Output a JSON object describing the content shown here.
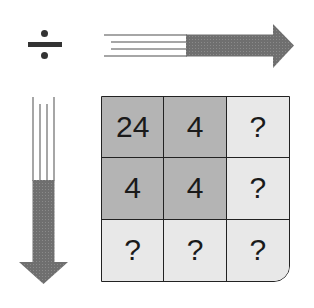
{
  "operation": {
    "symbol": "÷",
    "name": "division"
  },
  "arrows": {
    "horizontal": "right-arrow",
    "vertical": "down-arrow"
  },
  "grid": {
    "rows": [
      [
        {
          "value": "24",
          "known": true
        },
        {
          "value": "4",
          "known": true
        },
        {
          "value": "?",
          "known": false
        }
      ],
      [
        {
          "value": "4",
          "known": true
        },
        {
          "value": "4",
          "known": true
        },
        {
          "value": "?",
          "known": false
        }
      ],
      [
        {
          "value": "?",
          "known": false
        },
        {
          "value": "?",
          "known": false
        },
        {
          "value": "?",
          "known": false
        }
      ]
    ]
  },
  "colors": {
    "known_cell": "#b4b4b4",
    "unknown_cell": "#e8e8e8",
    "arrow": "#707070",
    "border": "#222222"
  }
}
